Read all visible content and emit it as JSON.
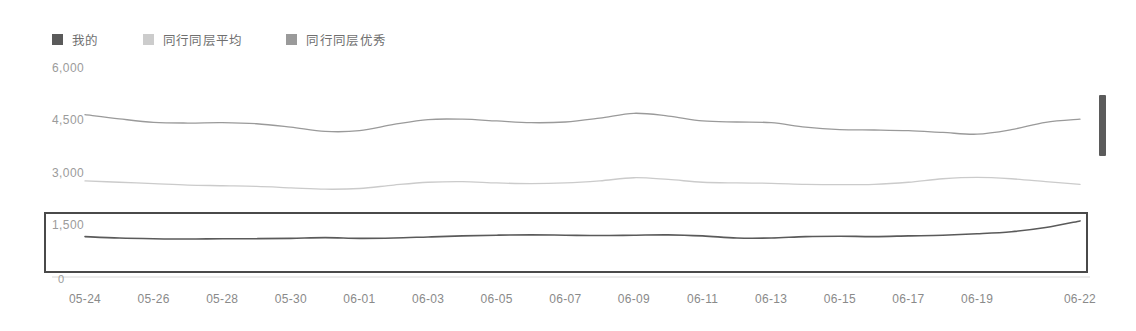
{
  "legend": {
    "position": "top-left",
    "items": [
      {
        "label": "我的",
        "color": "#5a5a5a",
        "icon": "legend-swatch-icon"
      },
      {
        "label": "同行同层平均",
        "color": "#cccccc",
        "icon": "legend-swatch-icon"
      },
      {
        "label": "同行同层优秀",
        "color": "#9a9a9a",
        "icon": "legend-swatch-icon"
      }
    ]
  },
  "chart_data": {
    "type": "line",
    "title": "",
    "xlabel": "",
    "ylabel": "",
    "ylim": [
      0,
      6000
    ],
    "yticks": [
      0,
      1500,
      3000,
      4500,
      6000
    ],
    "ytick_labels": [
      "0",
      "1,500",
      "3,000",
      "4,500",
      "6,000"
    ],
    "grid": false,
    "legend_position": "top-left",
    "x": [
      "05-24",
      "05-25",
      "05-26",
      "05-27",
      "05-28",
      "05-29",
      "05-30",
      "05-31",
      "06-01",
      "06-02",
      "06-03",
      "06-04",
      "06-05",
      "06-06",
      "06-07",
      "06-08",
      "06-09",
      "06-10",
      "06-11",
      "06-12",
      "06-13",
      "06-14",
      "06-15",
      "06-16",
      "06-17",
      "06-18",
      "06-19",
      "06-20",
      "06-21",
      "06-22"
    ],
    "xtick_labels": [
      "05-24",
      "05-26",
      "05-28",
      "05-30",
      "06-01",
      "06-03",
      "06-05",
      "06-07",
      "06-09",
      "06-11",
      "06-13",
      "06-15",
      "06-17",
      "06-19",
      "06-22"
    ],
    "series": [
      {
        "name": "同行同层优秀",
        "color": "#9a9a9a",
        "values": [
          4660,
          4540,
          4440,
          4420,
          4430,
          4400,
          4300,
          4180,
          4200,
          4380,
          4520,
          4530,
          4480,
          4430,
          4450,
          4560,
          4700,
          4620,
          4480,
          4450,
          4430,
          4300,
          4230,
          4220,
          4200,
          4150,
          4100,
          4230,
          4440,
          4530
        ]
      },
      {
        "name": "同行同层平均",
        "color": "#cbcbcb",
        "values": [
          2760,
          2720,
          2680,
          2640,
          2620,
          2600,
          2560,
          2520,
          2540,
          2640,
          2720,
          2740,
          2700,
          2680,
          2700,
          2760,
          2850,
          2800,
          2720,
          2700,
          2690,
          2660,
          2650,
          2660,
          2720,
          2820,
          2860,
          2820,
          2740,
          2660
        ]
      },
      {
        "name": "我的",
        "color": "#5a5a5a",
        "values": [
          1160,
          1120,
          1100,
          1090,
          1100,
          1100,
          1110,
          1130,
          1110,
          1120,
          1150,
          1180,
          1200,
          1210,
          1200,
          1190,
          1200,
          1210,
          1180,
          1120,
          1120,
          1160,
          1170,
          1160,
          1180,
          1200,
          1240,
          1300,
          1420,
          1610
        ]
      }
    ]
  },
  "selection": {
    "name": "series-highlight-box",
    "series_highlighted": "我的",
    "border_color": "#4a4a4a"
  },
  "scroll_handle": {
    "name": "vertical-scroll-handle",
    "color": "#5b5b5b"
  }
}
